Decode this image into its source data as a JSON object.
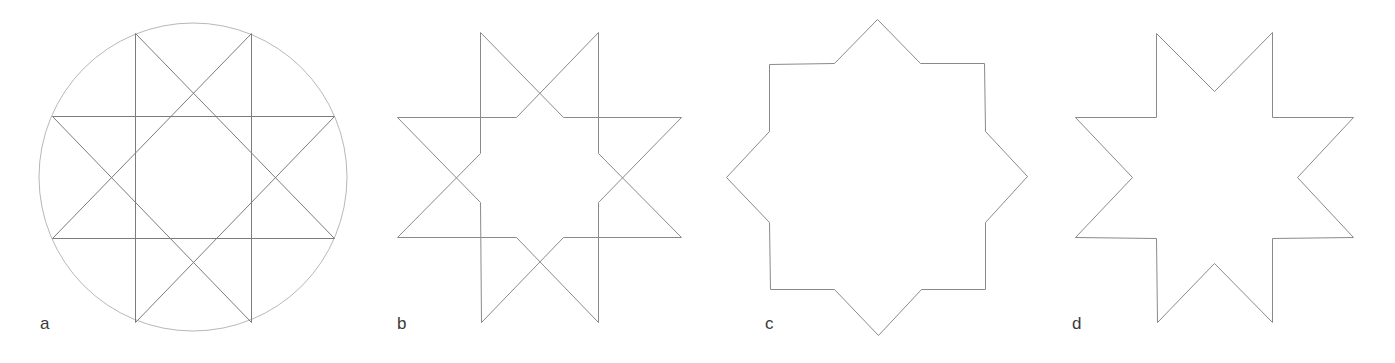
{
  "diagram": {
    "title": "",
    "stroke_color": "#8a8a8a",
    "circle_color": "#b8b8b8",
    "label_color": "#3a3a3a",
    "panels": [
      {
        "id": "a",
        "label": "a",
        "label_pos": [
          40,
          315
        ],
        "description": "Eight-pointed {8/3} star polygon inscribed in a circle",
        "circle": {
          "cx": 193,
          "cy": 177,
          "r": 154
        },
        "polygons": [
          [
            [
              135,
              33
            ],
            [
              334,
              238
            ],
            [
              52,
              238
            ],
            [
              251,
              33
            ],
            [
              251,
              322
            ],
            [
              52,
              116
            ],
            [
              334,
              116
            ],
            [
              135,
              322
            ]
          ]
        ]
      },
      {
        "id": "b",
        "label": "b",
        "label_pos": [
          397,
          315
        ],
        "description": "Two interlacing octagonal loops forming the star with inner segments removed",
        "polygons": [
          [
            [
              480,
              32
            ],
            [
              480,
              153
            ],
            [
              397,
              237
            ],
            [
              516,
              237
            ],
            [
              598,
              322
            ],
            [
              598,
              202
            ],
            [
              681,
              117
            ],
            [
              563,
              117
            ]
          ],
          [
            [
              598,
              32
            ],
            [
              598,
              153
            ],
            [
              681,
              237
            ],
            [
              563,
              237
            ],
            [
              481,
              322
            ],
            [
              480,
              202
            ],
            [
              397,
              117
            ],
            [
              516,
              117
            ]
          ]
        ]
      },
      {
        "id": "c",
        "label": "c",
        "label_pos": [
          765,
          315
        ],
        "description": "Outer outline of the eight-pointed star",
        "polygons": [
          [
            [
              877,
              19
            ],
            [
              920,
              63
            ],
            [
              984,
              63
            ],
            [
              985,
              131
            ],
            [
              1027,
              176
            ],
            [
              985,
              222
            ],
            [
              985,
              289
            ],
            [
              921,
              289
            ],
            [
              878,
              335
            ],
            [
              834,
              289
            ],
            [
              770,
              289
            ],
            [
              769,
              222
            ],
            [
              726,
              177
            ],
            [
              769,
              131
            ],
            [
              769,
              64
            ],
            [
              834,
              63
            ]
          ]
        ]
      },
      {
        "id": "d",
        "label": "d",
        "label_pos": [
          1072,
          315
        ],
        "description": "Eight-pointed star with concave notches",
        "polygons": [
          [
            [
              1156,
              33
            ],
            [
              1214,
              91
            ],
            [
              1272,
              32
            ],
            [
              1272,
              117
            ],
            [
              1353,
              117
            ],
            [
              1297,
              177
            ],
            [
              1353,
              237
            ],
            [
              1272,
              238
            ],
            [
              1272,
              322
            ],
            [
              1214,
              263
            ],
            [
              1157,
              322
            ],
            [
              1156,
              238
            ],
            [
              1075,
              237
            ],
            [
              1132,
              177
            ],
            [
              1075,
              117
            ],
            [
              1156,
              117
            ]
          ]
        ]
      }
    ]
  }
}
